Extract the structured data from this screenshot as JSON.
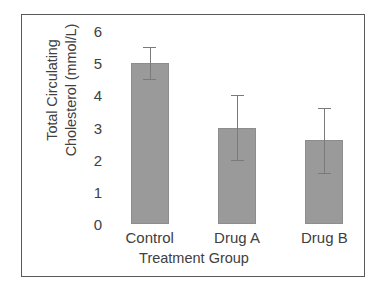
{
  "chart_data": {
    "type": "bar",
    "title": "",
    "xlabel": "Treatment Group",
    "ylabel": "Total Circulating Cholesterol (mmol/L)",
    "ylabel_lines": [
      "Total Circulating",
      "Cholesterol (mmol/L)"
    ],
    "categories": [
      "Control",
      "Drug A",
      "Drug B"
    ],
    "values": [
      5.0,
      3.0,
      2.6
    ],
    "errors": [
      0.5,
      1.0,
      1.0
    ],
    "error_type": "symmetric",
    "ylim": [
      0,
      6
    ],
    "yticks": [
      0,
      1,
      2,
      3,
      4,
      5,
      6
    ],
    "ytick_labels": [
      "0",
      "1",
      "2",
      "3",
      "4",
      "5",
      "6"
    ],
    "grid": false,
    "legend": null,
    "bar_color": "#9a9a9a",
    "bar_edge_color": "#8d8d8d",
    "errorbar_color": "#7a7a7a",
    "axis_text_color": "#404040",
    "frame_color": "#595959",
    "background": "#ffffff"
  },
  "figure": {
    "frame_visible": true,
    "plot_background": "#ffffff"
  }
}
